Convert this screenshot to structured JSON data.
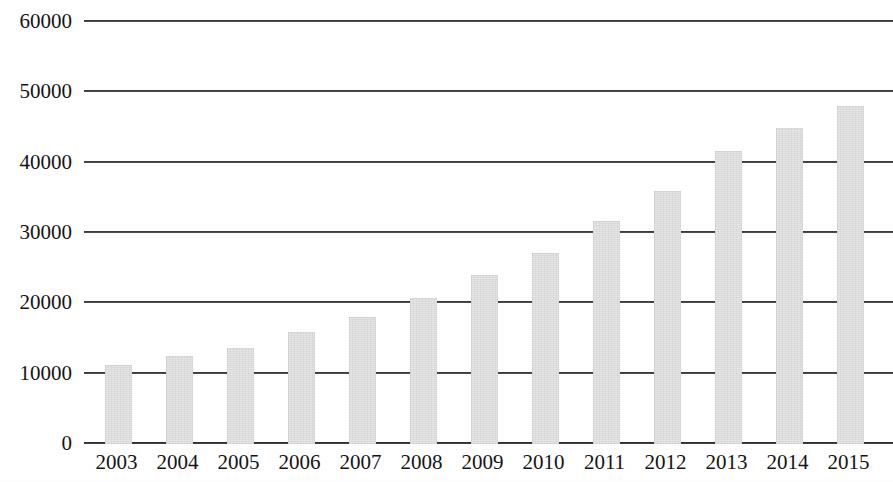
{
  "chart_data": {
    "type": "bar",
    "title": "",
    "subtitle": "",
    "xlabel": "",
    "ylabel": "",
    "categories": [
      "2003",
      "2004",
      "2005",
      "2006",
      "2007",
      "2008",
      "2009",
      "2010",
      "2011",
      "2012",
      "2013",
      "2014",
      "2015"
    ],
    "values": [
      11200,
      12500,
      13600,
      15900,
      18000,
      20700,
      24100,
      27100,
      31700,
      36000,
      41600,
      44900,
      48100
    ],
    "series": [
      {
        "name": "",
        "values": [
          11200,
          12500,
          13600,
          15900,
          18000,
          20700,
          24100,
          27100,
          31700,
          36000,
          41600,
          44900,
          48100
        ]
      }
    ],
    "ylim": [
      0,
      60000
    ],
    "ytick_labels": [
      "0",
      "10000",
      "20000",
      "30000",
      "40000",
      "50000",
      "60000"
    ],
    "ytick_values": [
      0,
      10000,
      20000,
      30000,
      40000,
      50000,
      60000
    ],
    "grid": true,
    "grid_axis": "y",
    "legend": false,
    "legend_position": "none",
    "bar_color": "#e4e4e4",
    "gridline_color": "#2e2e2e",
    "text_color": "#141414",
    "background_color": "#ffffff"
  }
}
